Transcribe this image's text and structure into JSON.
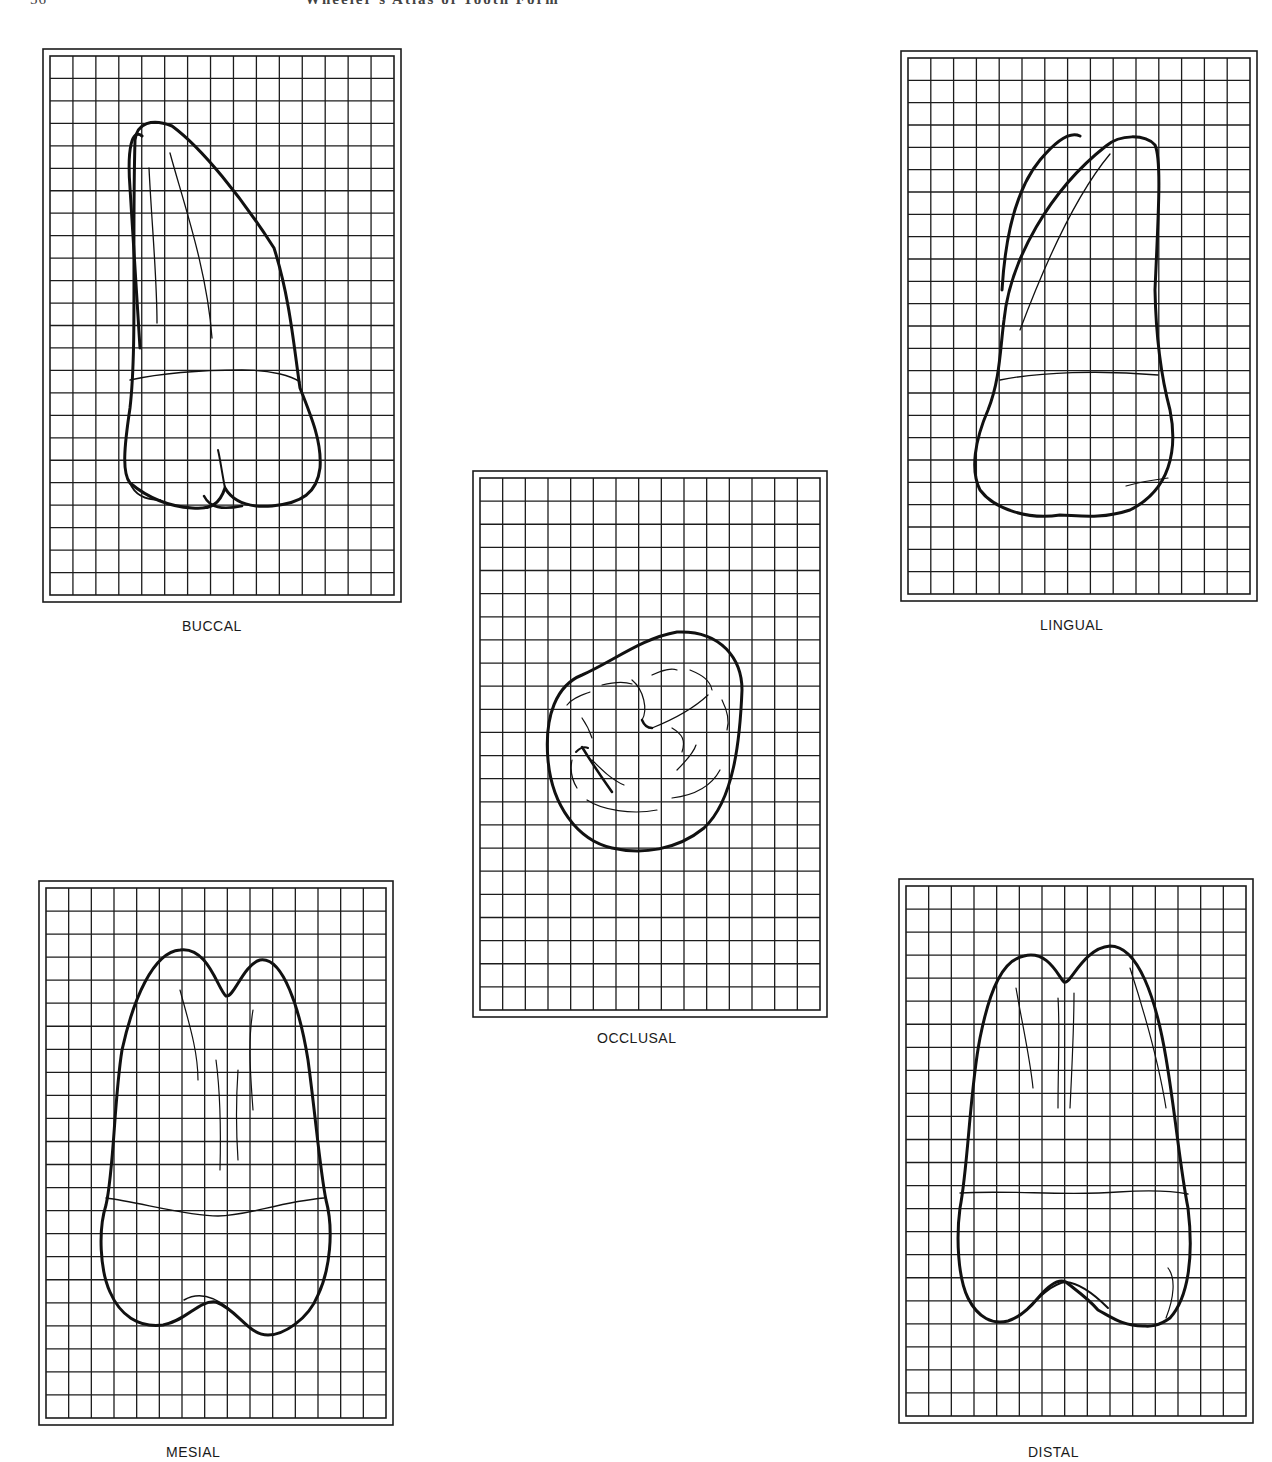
{
  "page": {
    "running_head_page_number": "56",
    "running_head_title": "Wheeler's Atlas of Tooth Form"
  },
  "figure": {
    "grid": {
      "columns": 15,
      "rows": 24,
      "cell_px": 23,
      "line_color": "#1c1c1c"
    },
    "outline_color": "#111111",
    "views": [
      {
        "id": "buccal",
        "label": "BUCCAL"
      },
      {
        "id": "lingual",
        "label": "LINGUAL"
      },
      {
        "id": "occlusal",
        "label": "OCCLUSAL"
      },
      {
        "id": "mesial",
        "label": "MESIAL"
      },
      {
        "id": "distal",
        "label": "DISTAL"
      }
    ]
  }
}
